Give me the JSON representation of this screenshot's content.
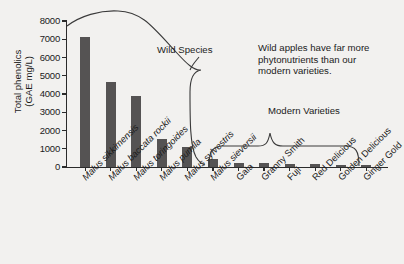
{
  "chart_data": {
    "type": "bar",
    "title": "",
    "xlabel": "",
    "ylabel": "Total phenolics (GAE mg/L)",
    "ylabel_line1": "Total phenolics",
    "ylabel_line2": "(GAE mg/L)",
    "ylim": [
      0,
      8000
    ],
    "ytick_labels": [
      "8000",
      "7000",
      "6000",
      "5000",
      "4000",
      "3000",
      "2000",
      "1000",
      "0"
    ],
    "ytick_values": [
      8000,
      7000,
      6000,
      5000,
      4000,
      3000,
      2000,
      1000,
      0
    ],
    "grid": false,
    "legend": "none",
    "categories": [
      "Malus sikkimensis",
      "Malus baccata rockii",
      "Malus toringoides",
      "Malus pumila",
      "Malus sylvestris",
      "Malus sieversii",
      "Gala",
      "Granny Smith",
      "Fuji",
      "Red Delicious",
      "Golden Delicious",
      "Ginger Gold"
    ],
    "values": [
      7150,
      4650,
      3870,
      1550,
      1120,
      420,
      230,
      230,
      175,
      185,
      95,
      85
    ],
    "bar_color": "#555353",
    "groups": [
      {
        "label": "Wild Species",
        "members": [
          "Malus sikkimensis",
          "Malus baccata rockii",
          "Malus toringoides",
          "Malus pumila",
          "Malus sylvestris",
          "Malus sieversii"
        ]
      },
      {
        "label": "Modern Varieties",
        "members": [
          "Gala",
          "Granny Smith",
          "Fuji",
          "Red Delicious",
          "Golden Delicious",
          "Ginger Gold"
        ]
      }
    ],
    "annotations": [
      {
        "name": "wild-species-brace-label",
        "text": "Wild Species"
      },
      {
        "name": "modern-varieties-brace-label",
        "text": "Modern Varieties"
      },
      {
        "name": "callout-note",
        "text": "Wild apples have far more phytonutrients than our modern varieties."
      }
    ]
  },
  "axis": {
    "y_title_line1": "Total phenolics",
    "y_title_line2": "(GAE mg/L)"
  },
  "annotations": {
    "wild_species": "Wild Species",
    "modern_varieties": "Modern Varieties",
    "callout_line1": "Wild apples have far more",
    "callout_line2": "phytonutrients than our",
    "callout_line3": "modern varieties."
  },
  "colors": {
    "background": "#f2f1ef",
    "bar": "#555353",
    "axis": "#2b2b2b",
    "text": "#1b1b1b"
  }
}
